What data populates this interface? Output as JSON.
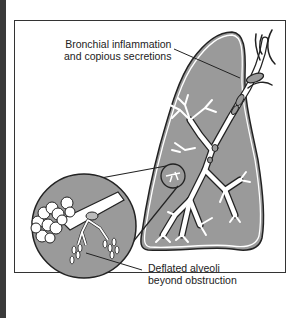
{
  "diagram": {
    "colors": {
      "lung_fill": "#9a9a9a",
      "outline": "#222222",
      "sidebar": "#3a3a3a"
    },
    "labels": {
      "top": {
        "line1": "Bronchial inflammation",
        "line2": "and copious secretions"
      },
      "bottom": {
        "line1": "Deflated alveoli",
        "line2": "beyond obstruction"
      }
    }
  }
}
